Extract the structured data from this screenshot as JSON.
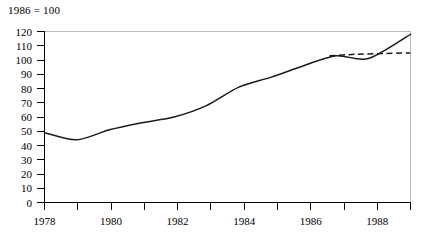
{
  "chart_data": {
    "type": "line",
    "title": "1986 = 100",
    "xlabel": "",
    "ylabel": "",
    "xlim": [
      1978,
      1989.3
    ],
    "ylim": [
      0,
      120
    ],
    "grid": false,
    "legend": "none",
    "y_ticks": [
      0,
      10,
      20,
      30,
      40,
      50,
      60,
      70,
      80,
      90,
      100,
      110,
      120
    ],
    "x_ticks_major": [
      1978,
      1980,
      1982,
      1984,
      1986,
      1988
    ],
    "x_ticks_minor": [
      1979,
      1981,
      1983,
      1985,
      1987,
      1989
    ],
    "series": [
      {
        "name": "actual",
        "style": "solid",
        "x": [
          1978,
          1979,
          1980,
          1981,
          1982,
          1983,
          1984,
          1985,
          1986,
          1987,
          1988,
          1989.3
        ],
        "values": [
          49,
          44,
          51,
          56,
          60,
          68,
          81,
          88,
          96,
          103,
          101,
          118
        ]
      },
      {
        "name": "trend",
        "style": "dashed",
        "x": [
          1986.8,
          1987.6,
          1989.3
        ],
        "values": [
          103,
          104,
          105
        ]
      }
    ]
  },
  "axis_note": "1986 = 100"
}
